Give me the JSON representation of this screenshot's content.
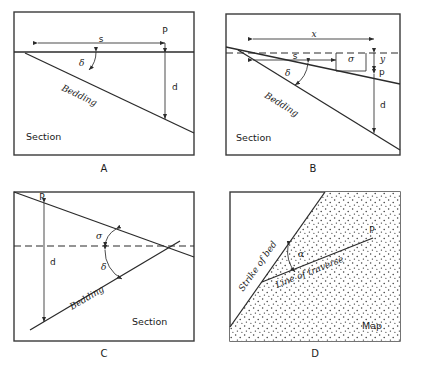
{
  "figure": {
    "panels": [
      {
        "id": "A",
        "letter": "A",
        "view_label": "Section",
        "description": "Horizontal ground surface with bedding dipping to the right",
        "labels": {
          "horizontal_distance": "s",
          "point": "P",
          "depth": "d",
          "dip_angle": "δ",
          "bedding": "Bedding"
        }
      },
      {
        "id": "B",
        "letter": "B",
        "view_label": "Section",
        "description": "Ground surface sloping down toward the point, bedding dipping more steeply in the same direction",
        "labels": {
          "slope_distance": "x",
          "horizontal_distance": "s",
          "slope_angle": "σ",
          "elevation_difference": "y",
          "point": "p",
          "depth": "d",
          "dip_angle": "δ",
          "bedding": "Bedding"
        }
      },
      {
        "id": "C",
        "letter": "C",
        "view_label": "Section",
        "description": "Ground surface sloping down to the right, bedding dipping in the opposite direction",
        "labels": {
          "point": "P",
          "depth": "d",
          "slope_angle": "σ",
          "dip_angle": "δ",
          "bedding": "Bedding"
        }
      },
      {
        "id": "D",
        "letter": "D",
        "view_label": "Map",
        "description": "Map view showing the angle between the strike of bed and the line of traverse",
        "labels": {
          "strike": "Strike of bed",
          "traverse": "Line of traverse",
          "angle": "α",
          "point": "P"
        }
      }
    ],
    "colors": {
      "ink": "#2b2b2b",
      "frame": "#3a3a3a",
      "background": "#ffffff",
      "stipple": "#3b3b3b"
    }
  }
}
